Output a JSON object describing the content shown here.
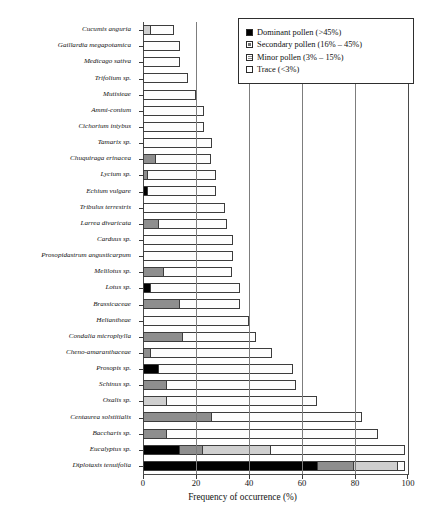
{
  "chart_data": {
    "type": "bar",
    "orientation": "horizontal",
    "stacked": true,
    "title": "",
    "xlabel": "Frequency of occurrence (%)",
    "ylabel": "",
    "xlim": [
      0,
      100
    ],
    "xticks": [
      0,
      20,
      40,
      60,
      80,
      100
    ],
    "xticklabels": [
      "0",
      "20",
      "40",
      "60",
      "80",
      "100"
    ],
    "grid": "vertical gridlines at 20, 40, 60, 80",
    "legend_position": "top-right inside plot",
    "series": [
      {
        "name": "Dominant pollen (>45%)",
        "key": "dominant"
      },
      {
        "name": "Secondary pollen (16% – 45%)",
        "key": "secondary"
      },
      {
        "name": "Minor pollen (3% – 15%)",
        "key": "minor"
      },
      {
        "name": "Trace (<3%)",
        "key": "trace"
      }
    ],
    "categories": [
      "Cucumis anguria",
      "Gaillardia megapotamica",
      "Medicago sativa",
      "Trifolium sp.",
      "Mutisieae",
      "Ammi-conium",
      "Cichorium intybus",
      "Tamarix sp.",
      "Chuquiraga erinacea",
      "Lycium sp.",
      "Echium vulgare",
      "Tribulus terrestris",
      "Larrea divaricata",
      "Carduus sp.",
      "Prosopidastrum angusticarpum",
      "Melilotus sp.",
      "Lotus sp.",
      "Brassicaceae",
      "Heliantheae",
      "Condalia microphylla",
      "Cheno-amaranthaceae",
      "Prosopis sp.",
      "Schinus sp.",
      "Oxalis sp.",
      "Centaurea solstitialis",
      "Baccharis sp.",
      "Eucalyptus sp.",
      "Diplotaxis tenuifolia"
    ],
    "rows": [
      {
        "category": "Cucumis anguria",
        "dominant": 0,
        "secondary": 0,
        "minor": 3,
        "trace": 9,
        "total": 12
      },
      {
        "category": "Gaillardia megapotamica",
        "dominant": 0,
        "secondary": 0,
        "minor": 0,
        "trace": 14,
        "total": 14
      },
      {
        "category": "Medicago sativa",
        "dominant": 0,
        "secondary": 0,
        "minor": 0,
        "trace": 14,
        "total": 14
      },
      {
        "category": "Trifolium sp.",
        "dominant": 0,
        "secondary": 0,
        "minor": 0,
        "trace": 17,
        "total": 17
      },
      {
        "category": "Mutisieae",
        "dominant": 0,
        "secondary": 0,
        "minor": 0,
        "trace": 20,
        "total": 20
      },
      {
        "category": "Ammi-conium",
        "dominant": 0,
        "secondary": 0,
        "minor": 0,
        "trace": 23,
        "total": 23
      },
      {
        "category": "Cichorium intybus",
        "dominant": 0,
        "secondary": 0,
        "minor": 0,
        "trace": 23,
        "total": 23
      },
      {
        "category": "Tamarix sp.",
        "dominant": 0,
        "secondary": 0,
        "minor": 0,
        "trace": 26,
        "total": 26
      },
      {
        "category": "Chuquiraga erinacea",
        "dominant": 0,
        "secondary": 5,
        "minor": 0,
        "trace": 21,
        "total": 26
      },
      {
        "category": "Lycium sp.",
        "dominant": 0,
        "secondary": 2,
        "minor": 0,
        "trace": 26,
        "total": 28
      },
      {
        "category": "Echium vulgare",
        "dominant": 2,
        "secondary": 0,
        "minor": 0,
        "trace": 26,
        "total": 28
      },
      {
        "category": "Tribulus terrestris",
        "dominant": 0,
        "secondary": 0,
        "minor": 0,
        "trace": 31,
        "total": 31
      },
      {
        "category": "Larrea divaricata",
        "dominant": 0,
        "secondary": 6,
        "minor": 0,
        "trace": 26,
        "total": 32
      },
      {
        "category": "Carduus sp.",
        "dominant": 0,
        "secondary": 0,
        "minor": 0,
        "trace": 34,
        "total": 34
      },
      {
        "category": "Prosopidastrum angusticarpum",
        "dominant": 0,
        "secondary": 0,
        "minor": 0,
        "trace": 34,
        "total": 34
      },
      {
        "category": "Melilotus sp.",
        "dominant": 0,
        "secondary": 8,
        "minor": 0,
        "trace": 26,
        "total": 34
      },
      {
        "category": "Lotus sp.",
        "dominant": 3,
        "secondary": 0,
        "minor": 0,
        "trace": 34,
        "total": 37
      },
      {
        "category": "Brassicaceae",
        "dominant": 0,
        "secondary": 14,
        "minor": 0,
        "trace": 23,
        "total": 37
      },
      {
        "category": "Heliantheae",
        "dominant": 0,
        "secondary": 0,
        "minor": 0,
        "trace": 40,
        "total": 40
      },
      {
        "category": "Condalia microphylla",
        "dominant": 0,
        "secondary": 15,
        "minor": 0,
        "trace": 28,
        "total": 43
      },
      {
        "category": "Cheno-amaranthaceae",
        "dominant": 0,
        "secondary": 3,
        "minor": 0,
        "trace": 46,
        "total": 49
      },
      {
        "category": "Prosopis sp.",
        "dominant": 6,
        "secondary": 0,
        "minor": 0,
        "trace": 51,
        "total": 57
      },
      {
        "category": "Schinus sp.",
        "dominant": 0,
        "secondary": 9,
        "minor": 0,
        "trace": 49,
        "total": 58
      },
      {
        "category": "Oxalis sp.",
        "dominant": 0,
        "secondary": 0,
        "minor": 9,
        "trace": 57,
        "total": 66
      },
      {
        "category": "Centaurea solstitialis",
        "dominant": 0,
        "secondary": 26,
        "minor": 0,
        "trace": 57,
        "total": 83
      },
      {
        "category": "Baccharis sp.",
        "dominant": 0,
        "secondary": 9,
        "minor": 0,
        "trace": 80,
        "total": 89
      },
      {
        "category": "Eucalyptus sp.",
        "dominant": 14,
        "secondary": 9,
        "minor": 26,
        "trace": 51,
        "total": 100
      },
      {
        "category": "Diplotaxis tenuifolia",
        "dominant": 66,
        "secondary": 14,
        "minor": 17,
        "trace": 3,
        "total": 100
      }
    ]
  },
  "colors": {
    "dominant": "#000000",
    "secondary": "#8e8e8e",
    "minor": "#cfcfcf",
    "trace": "#fdfdfd",
    "axis": "#3a3a3a",
    "grid": "#7d7d7d"
  }
}
